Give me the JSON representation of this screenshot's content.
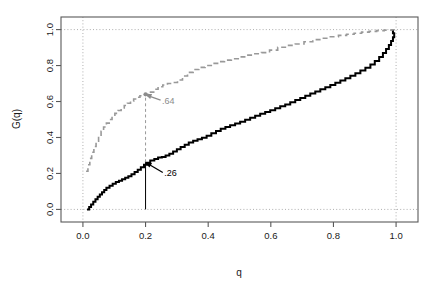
{
  "chart_data": {
    "type": "line",
    "title": "",
    "subtitle": "",
    "xlabel": "q",
    "ylabel": "G(q)",
    "xlim": [
      -0.07,
      1.07
    ],
    "ylim": [
      -0.07,
      1.07
    ],
    "xticks": [
      0.0,
      0.2,
      0.4,
      0.6,
      0.8,
      1.0
    ],
    "xticklabels": [
      "0.0",
      "0.2",
      "0.4",
      "0.6",
      "0.8",
      "1.0"
    ],
    "yticks": [
      0.0,
      0.2,
      0.4,
      0.6,
      0.8,
      1.0
    ],
    "yticklabels": [
      "0.0",
      "0.2",
      "0.4",
      "0.6",
      "0.8",
      "1.0"
    ],
    "grid": true,
    "grid_style": "dotted",
    "gridlines_x": [
      0.0,
      1.0
    ],
    "gridlines_y": [
      0.0,
      1.0
    ],
    "legend": "none",
    "series": [
      {
        "name": "black-step-curve",
        "style": "solid",
        "color": "#000000",
        "linewidth": 2.0,
        "step": true,
        "x": [
          0.013,
          0.02,
          0.026,
          0.033,
          0.04,
          0.047,
          0.054,
          0.061,
          0.068,
          0.075,
          0.085,
          0.095,
          0.105,
          0.115,
          0.125,
          0.135,
          0.145,
          0.155,
          0.165,
          0.175,
          0.185,
          0.195,
          0.205,
          0.215,
          0.228,
          0.24,
          0.252,
          0.264,
          0.276,
          0.288,
          0.3,
          0.312,
          0.325,
          0.338,
          0.352,
          0.366,
          0.38,
          0.395,
          0.41,
          0.425,
          0.44,
          0.455,
          0.47,
          0.486,
          0.502,
          0.518,
          0.534,
          0.55,
          0.566,
          0.582,
          0.598,
          0.614,
          0.63,
          0.646,
          0.662,
          0.678,
          0.694,
          0.71,
          0.726,
          0.742,
          0.758,
          0.774,
          0.79,
          0.806,
          0.822,
          0.838,
          0.854,
          0.87,
          0.886,
          0.902,
          0.918,
          0.932,
          0.946,
          0.958,
          0.968,
          0.977,
          0.984,
          0.99,
          0.994,
          0.99
        ],
        "y": [
          0.0,
          0.013,
          0.028,
          0.042,
          0.056,
          0.07,
          0.083,
          0.096,
          0.108,
          0.12,
          0.132,
          0.143,
          0.152,
          0.16,
          0.168,
          0.176,
          0.185,
          0.196,
          0.208,
          0.221,
          0.234,
          0.248,
          0.26,
          0.272,
          0.281,
          0.288,
          0.292,
          0.3,
          0.31,
          0.322,
          0.334,
          0.347,
          0.36,
          0.372,
          0.382,
          0.39,
          0.398,
          0.41,
          0.423,
          0.436,
          0.448,
          0.458,
          0.468,
          0.478,
          0.488,
          0.499,
          0.51,
          0.521,
          0.532,
          0.542,
          0.552,
          0.562,
          0.573,
          0.584,
          0.596,
          0.608,
          0.62,
          0.632,
          0.644,
          0.656,
          0.668,
          0.68,
          0.692,
          0.704,
          0.717,
          0.73,
          0.743,
          0.757,
          0.772,
          0.788,
          0.806,
          0.826,
          0.848,
          0.87,
          0.892,
          0.914,
          0.936,
          0.958,
          0.98,
          1.0
        ]
      },
      {
        "name": "gray-dashed-step-curve",
        "style": "dashed",
        "color": "#999999",
        "linewidth": 1.6,
        "step": true,
        "x": [
          0.01,
          0.016,
          0.022,
          0.028,
          0.035,
          0.042,
          0.05,
          0.058,
          0.066,
          0.075,
          0.084,
          0.093,
          0.102,
          0.112,
          0.122,
          0.132,
          0.142,
          0.152,
          0.162,
          0.172,
          0.182,
          0.192,
          0.2,
          0.212,
          0.226,
          0.24,
          0.255,
          0.27,
          0.286,
          0.302,
          0.318,
          0.334,
          0.352,
          0.37,
          0.39,
          0.41,
          0.43,
          0.452,
          0.474,
          0.496,
          0.52,
          0.545,
          0.57,
          0.596,
          0.622,
          0.65,
          0.678,
          0.706,
          0.734,
          0.762,
          0.79,
          0.816,
          0.842,
          0.866,
          0.89,
          0.914,
          0.938,
          0.962,
          0.986,
          1.0
        ],
        "y": [
          0.212,
          0.248,
          0.284,
          0.318,
          0.35,
          0.38,
          0.408,
          0.434,
          0.458,
          0.48,
          0.5,
          0.518,
          0.534,
          0.55,
          0.564,
          0.578,
          0.59,
          0.602,
          0.614,
          0.624,
          0.632,
          0.638,
          0.64,
          0.652,
          0.668,
          0.682,
          0.692,
          0.7,
          0.706,
          0.72,
          0.742,
          0.762,
          0.778,
          0.79,
          0.8,
          0.812,
          0.822,
          0.83,
          0.838,
          0.848,
          0.858,
          0.866,
          0.872,
          0.886,
          0.902,
          0.912,
          0.92,
          0.932,
          0.944,
          0.952,
          0.96,
          0.968,
          0.974,
          0.98,
          0.986,
          0.99,
          0.994,
          0.997,
          0.999,
          1.0
        ]
      }
    ],
    "annotations": [
      {
        "name": "black-point-annotation",
        "label": ".26",
        "point_x": 0.2,
        "point_y": 0.262,
        "text_x": 0.255,
        "text_y": 0.205,
        "color": "#000000",
        "arrow": true
      },
      {
        "name": "gray-point-annotation",
        "label": ".64",
        "point_x": 0.2,
        "point_y": 0.64,
        "text_x": 0.248,
        "text_y": 0.608,
        "color": "#8c8c8c",
        "arrow": true
      }
    ],
    "reference_lines": [
      {
        "name": "black-vertical-drop",
        "x": 0.2,
        "y_from": 0.0,
        "y_to": 0.262,
        "color": "#000000",
        "style": "solid"
      },
      {
        "name": "gray-vertical-drop",
        "x": 0.2,
        "y_from": 0.262,
        "y_to": 0.64,
        "color": "#999999",
        "style": "dashed"
      }
    ],
    "markers": [
      {
        "name": "gray-point-marker",
        "x": 0.2,
        "y": 0.64,
        "color": "#8c8c8c"
      }
    ]
  },
  "axes": {
    "x_title": "q",
    "y_title": "G(q)",
    "x_tick_labels": [
      "0.0",
      "0.2",
      "0.4",
      "0.6",
      "0.8",
      "1.0"
    ],
    "y_tick_labels": [
      "0.0",
      "0.2",
      "0.4",
      "0.6",
      "0.8",
      "1.0"
    ]
  },
  "colors": {
    "black_curve": "#000000",
    "gray_curve": "#999999",
    "gray_label": "#8c8c8c",
    "frame": "#595959",
    "grid": "#a6a6a6",
    "background": "#ffffff"
  }
}
